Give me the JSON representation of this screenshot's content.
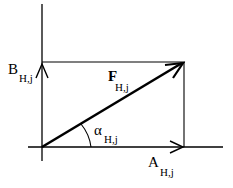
{
  "diagram": {
    "type": "vector-decomposition",
    "labels": {
      "vertical_component": {
        "main": "B",
        "sub": "H,j"
      },
      "resultant": {
        "main": "F",
        "sub": "H,j"
      },
      "angle": {
        "main": "α",
        "sub": "H,j"
      },
      "horizontal_component": {
        "main": "A",
        "sub": "H,j"
      }
    },
    "colors": {
      "stroke": "#000000",
      "background": "#ffffff"
    }
  }
}
